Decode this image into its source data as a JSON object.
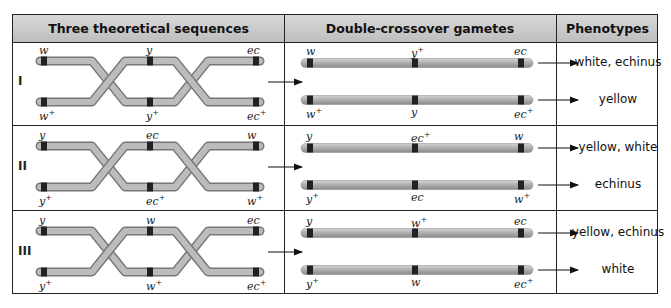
{
  "header": {
    "col1": "Three theoretical sequences",
    "col2": "Double-crossover gametes",
    "col3": "Phenotypes"
  },
  "rows": [
    {
      "roman": "I",
      "top_labels": [
        "w",
        "y",
        "ec"
      ],
      "bottom_labels": [
        "w",
        "y",
        "ec"
      ],
      "bottom_plus": [
        true,
        true,
        true
      ],
      "gamete1_labels": [
        "w",
        "y",
        "ec"
      ],
      "gamete1_plus": [
        false,
        true,
        false
      ],
      "gamete2_labels": [
        "w",
        "y",
        "ec"
      ],
      "gamete2_plus": [
        true,
        false,
        true
      ],
      "phenotype1": "white, echinus",
      "phenotype2": "yellow"
    },
    {
      "roman": "II",
      "top_labels": [
        "y",
        "ec",
        "w"
      ],
      "bottom_labels": [
        "y",
        "ec",
        "w"
      ],
      "bottom_plus": [
        true,
        true,
        true
      ],
      "gamete1_labels": [
        "y",
        "ec",
        "w"
      ],
      "gamete1_plus": [
        false,
        true,
        false
      ],
      "gamete2_labels": [
        "y",
        "ec",
        "w"
      ],
      "gamete2_plus": [
        true,
        false,
        true
      ],
      "phenotype1": "yellow, white",
      "phenotype2": "echinus"
    },
    {
      "roman": "III",
      "top_labels": [
        "y",
        "w",
        "ec"
      ],
      "bottom_labels": [
        "y",
        "w",
        "ec"
      ],
      "bottom_plus": [
        true,
        true,
        true
      ],
      "gamete1_labels": [
        "y",
        "w",
        "ec"
      ],
      "gamete1_plus": [
        false,
        true,
        false
      ],
      "gamete2_labels": [
        "y",
        "w",
        "ec"
      ],
      "gamete2_plus": [
        true,
        false,
        true
      ],
      "phenotype1": "yellow, echinus",
      "phenotype2": "white"
    }
  ],
  "colors": {
    "header_bg": "#c9c9c9",
    "chromosome": "#a8a8a8",
    "band": "#222222",
    "border": "#222222"
  }
}
